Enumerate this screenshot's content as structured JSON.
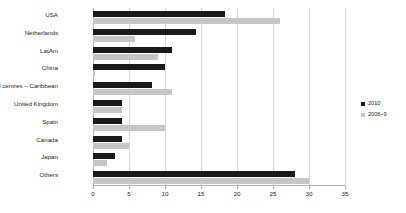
{
  "chart_data": {
    "type": "bar",
    "orientation": "horizontal",
    "title": "",
    "xlabel": "",
    "ylabel": "",
    "xlim": [
      0,
      35
    ],
    "xticks": [
      0,
      5,
      10,
      15,
      20,
      25,
      30,
      35
    ],
    "grid": true,
    "legend_position": "center-right",
    "categories": [
      "USA",
      "Netherlands",
      "LatAm",
      "China",
      "Financial centres – Caribbean",
      "United Kingdom",
      "Spain",
      "Canada",
      "Japan",
      "Others"
    ],
    "series": [
      {
        "name": "2010",
        "color": "#1a1a1a",
        "values": [
          18.3,
          14.3,
          11.0,
          10.0,
          8.2,
          4.0,
          4.0,
          4.0,
          3.0,
          28.0
        ]
      },
      {
        "name": "2006–9",
        "color": "#c6c6c6",
        "values": [
          26.0,
          5.8,
          9.0,
          0.3,
          11.0,
          4.0,
          10.0,
          5.0,
          2.0,
          30.0
        ]
      }
    ]
  },
  "legend": {
    "items": [
      {
        "label": "2010"
      },
      {
        "label": "2006–9"
      }
    ]
  },
  "colors": {
    "series_2010": "#1a1a1a",
    "series_2006_9": "#c6c6c6",
    "gridline": "#d9d9d9",
    "axis": "#b3b3b3",
    "text": "#231f20",
    "background": "#ffffff"
  }
}
